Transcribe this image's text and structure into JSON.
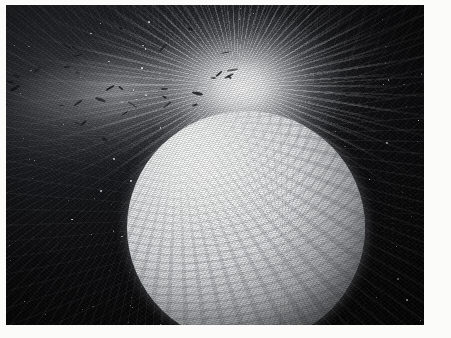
{
  "image": {
    "kind": "astronomical-illustration",
    "title": "Bright cloud-banded sphere with luminous eruption plume",
    "palette": "grayscale / monochrome",
    "frame": {
      "paper_color": "#fbfbfa",
      "margin_left_px": 6,
      "margin_top_px": 5,
      "margin_right_px": 27,
      "margin_bottom_px": 13,
      "plate_width_px": 418,
      "plate_height_px": 320
    },
    "background": {
      "name": "starfield",
      "base_color": "#050507",
      "haze_color": "#2b2c30",
      "grain": "heavy film grain with scattered white speckle"
    },
    "subjects": [
      {
        "name": "sphere",
        "label": "bright cloud-banded sphere",
        "highlight_color": "#ffffff",
        "midtone_color": "#c2c5c8",
        "shadow_color": "#232528",
        "center_pct": [
          57.5,
          69.5
        ],
        "diameter_pct": 57
      },
      {
        "name": "plume",
        "label": "luminous eruption plume",
        "core_color": "#ffffff",
        "ray_color": "#e6e8ea",
        "origin_pct": [
          55.5,
          25.5
        ],
        "fan_direction": "up-left and right-down"
      },
      {
        "name": "debris",
        "label": "dark debris streaks",
        "color": "#111316",
        "count": 34
      }
    ],
    "stars": {
      "color": "#f2f3f5",
      "count": 120
    }
  }
}
